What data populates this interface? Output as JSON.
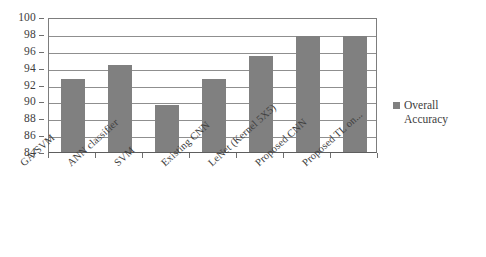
{
  "chart_data": {
    "type": "bar",
    "title": "",
    "subtitle": "",
    "xlabel": "",
    "ylabel": "",
    "categories": [
      "GA-SVM",
      "ANN classifier",
      "SVM",
      "Existing CNN",
      "LeNet (Kernel 5X5)",
      "Proposed CNN",
      "Proposed TL on..."
    ],
    "series": [
      {
        "name": "Overall Accuracy",
        "values": [
          92.7,
          94.3,
          89.6,
          92.7,
          95.4,
          97.7,
          97.8
        ]
      }
    ],
    "values": [
      92.7,
      94.3,
      89.6,
      92.7,
      95.4,
      97.7,
      97.8
    ],
    "ylim": [
      84,
      100
    ],
    "ytick_step": 2,
    "ytick_labels": [
      "100",
      "98",
      "96",
      "94",
      "92",
      "90",
      "88",
      "86",
      "84"
    ],
    "grid": true,
    "legend_position": "right",
    "legend_entries": [
      "Overall Accuracy"
    ],
    "bar_color": "#808080",
    "axis_color": "#7d7d7d",
    "grid_color": "#8f8f8f",
    "background_color": "#ffffff"
  },
  "legend": {
    "label_line1": "Overall",
    "label_line2": "Accuracy",
    "swatch_name": "legend-square-swatch"
  }
}
